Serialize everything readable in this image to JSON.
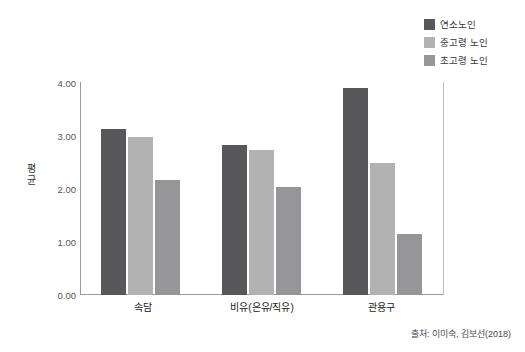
{
  "chart_data": {
    "type": "bar",
    "title": "",
    "subtitle": "",
    "xlabel": "",
    "ylabel": "평균",
    "ylim": [
      0,
      4.0
    ],
    "ytick_labels": [
      "0.00",
      "1.00",
      "2.00",
      "3.00",
      "4.00"
    ],
    "ytick_values": [
      0,
      1,
      2,
      3,
      4
    ],
    "grid": false,
    "legend_position": "top-right",
    "categories": [
      "속담",
      "비유(은유/직유)",
      "관용구"
    ],
    "series": [
      {
        "name": "연소노인",
        "color": "#58585a",
        "values": [
          3.11,
          2.82,
          3.89
        ]
      },
      {
        "name": "중고령 노인",
        "color": "#b2b2b2",
        "values": [
          2.96,
          2.73,
          2.47
        ]
      },
      {
        "name": "초고령 노인",
        "color": "#969698",
        "values": [
          2.16,
          2.03,
          1.14
        ]
      }
    ],
    "source": "출처: 이미숙, 김보선(2018)"
  },
  "legend": {
    "items": [
      {
        "label": "연소노인",
        "color": "#58585a"
      },
      {
        "label": "중고령 노인",
        "color": "#b2b2b2"
      },
      {
        "label": "초고령 노인",
        "color": "#969698"
      }
    ]
  },
  "axes": {
    "y_title": "평균",
    "y_ticks": [
      "4.00",
      "3.00",
      "2.00",
      "1.00",
      "0.00"
    ],
    "x_categories": [
      "속담",
      "비유(은유/직유)",
      "관용구"
    ]
  },
  "footer": {
    "source": "출처: 이미숙, 김보선(2018)"
  }
}
